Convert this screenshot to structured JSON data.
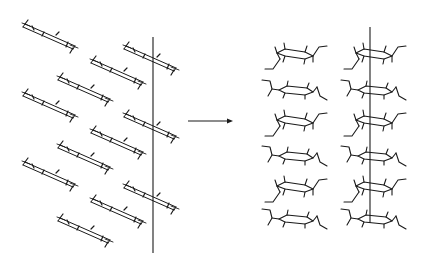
{
  "figure": {
    "arrow": {
      "from": [
        188,
        121
      ],
      "to": [
        232,
        121
      ]
    },
    "left_panel": {
      "axis_line": {
        "x": 153,
        "y1": 37,
        "y2": 253
      },
      "molecules": [
        {
          "cx": 50,
          "cy": 35
        },
        {
          "cx": 151,
          "cy": 57
        },
        {
          "cx": 118,
          "cy": 71
        },
        {
          "cx": 85,
          "cy": 88
        },
        {
          "cx": 50,
          "cy": 104
        },
        {
          "cx": 151,
          "cy": 125
        },
        {
          "cx": 118,
          "cy": 141
        },
        {
          "cx": 85,
          "cy": 156
        },
        {
          "cx": 50,
          "cy": 173
        },
        {
          "cx": 151,
          "cy": 196
        },
        {
          "cx": 118,
          "cy": 210
        },
        {
          "cx": 85,
          "cy": 229
        }
      ]
    },
    "right_panel": {
      "axis_line": {
        "x": 370,
        "y1": 27,
        "y2": 223
      },
      "columns": [
        {
          "cx": 295,
          "rows": [
            55,
            89,
            122,
            155,
            188,
            218
          ]
        },
        {
          "cx": 374,
          "rows": [
            55,
            89,
            122,
            155,
            188,
            218
          ]
        }
      ]
    }
  }
}
